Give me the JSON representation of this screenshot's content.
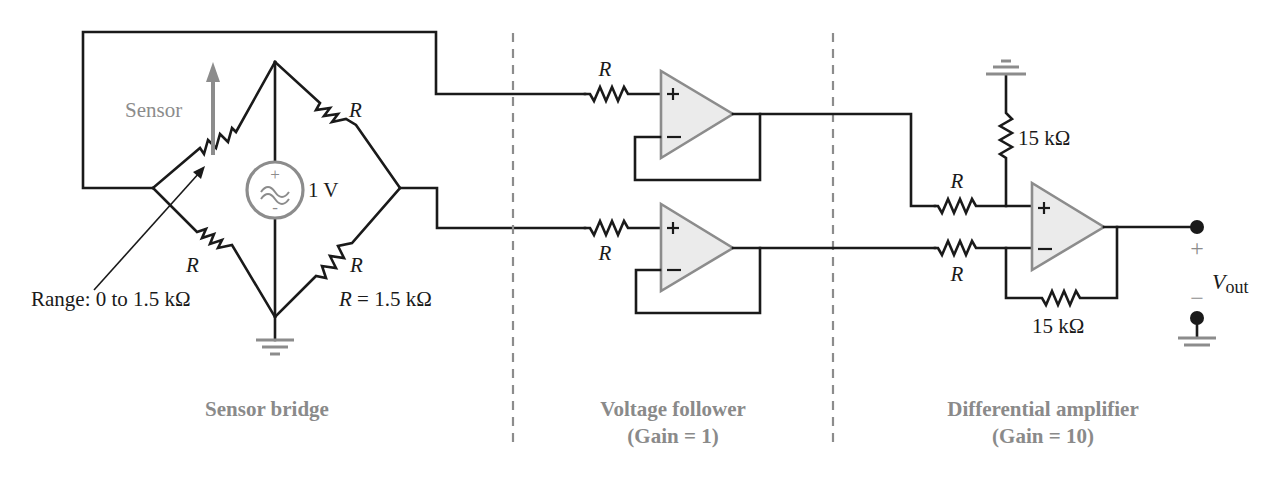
{
  "colors": {
    "wire": "#1a1a1a",
    "accent_gray": "#8c8c8c",
    "opamp_fill": "#ebebeb",
    "background": "#ffffff"
  },
  "sensor_bridge": {
    "sensor_label": "Sensor",
    "source_value": "1 V",
    "source_plus": "+",
    "source_minus": "-",
    "resistor_top_right": "R",
    "resistor_bottom_left": "R",
    "resistor_bottom_right": "R",
    "range_label": "Range: 0 to 1.5 kΩ",
    "r_value_symbol": "R",
    "r_value_rest": " = 1.5 kΩ",
    "caption": "Sensor bridge"
  },
  "voltage_follower": {
    "resistor_top": "R",
    "resistor_bottom": "R",
    "opamp_plus": "+",
    "opamp_minus": "−",
    "caption_line1": "Voltage follower",
    "caption_line2": "(Gain = 1)"
  },
  "differential_amplifier": {
    "resistor_plus_input": "R",
    "resistor_minus_input": "R",
    "resistor_to_ground": "15 kΩ",
    "resistor_feedback": "15 kΩ",
    "opamp_plus": "+",
    "opamp_minus": "−",
    "output_plus": "+",
    "output_minus": "−",
    "output_label_main": "V",
    "output_label_sub": "out",
    "caption_line1": "Differential amplifier",
    "caption_line2": "(Gain = 10)"
  }
}
